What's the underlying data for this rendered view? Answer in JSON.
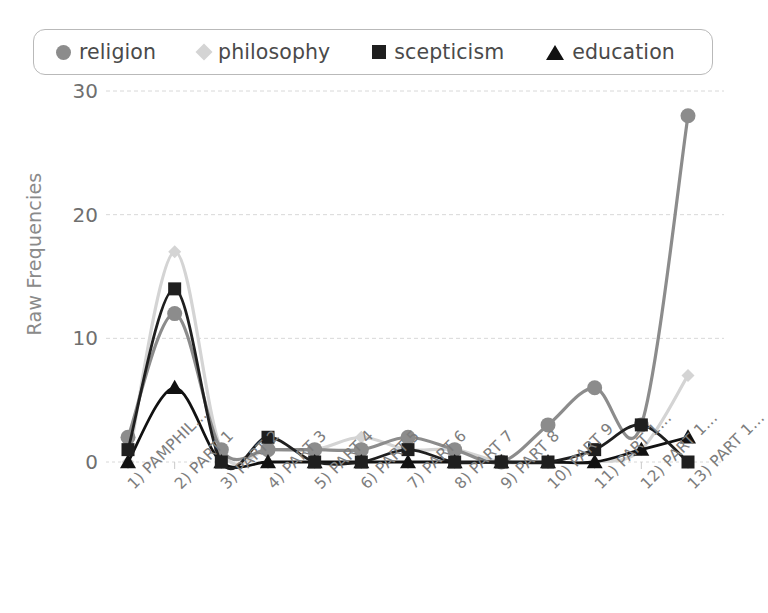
{
  "legend": {
    "position": "top",
    "items": [
      {
        "label": "religion",
        "marker": "circle",
        "color": "#8c8c8c",
        "name": "legend-marker-religion"
      },
      {
        "label": "philosophy",
        "marker": "diamond",
        "color": "#d4d4d4",
        "name": "legend-marker-philosophy"
      },
      {
        "label": "scepticism",
        "marker": "square",
        "color": "#1f1f1f",
        "name": "legend-marker-scepticism"
      },
      {
        "label": "education",
        "marker": "triangle",
        "color": "#111111",
        "name": "legend-marker-education"
      }
    ]
  },
  "chart_data": {
    "type": "line",
    "title": "",
    "xlabel": "",
    "ylabel": "Raw Frequencies",
    "ylim": [
      0,
      30
    ],
    "yticks": [
      0,
      10,
      20,
      30
    ],
    "grid": true,
    "legend_position": "top",
    "categories": [
      "1) PAMPHIL...",
      "2) PART 1",
      "3) PART 2",
      "4) PART 3",
      "5) PART 4",
      "6) PART 5",
      "7) PART 6",
      "8) PART 7",
      "9) PART 8",
      "10) PART 9",
      "11) PART 1...",
      "12) PART 1...",
      "13) PART 1..."
    ],
    "series": [
      {
        "name": "religion",
        "color": "#8c8c8c",
        "marker": "circle",
        "values": [
          2,
          12,
          1,
          1,
          1,
          1,
          2,
          1,
          0,
          3,
          6,
          3,
          28
        ]
      },
      {
        "name": "philosophy",
        "color": "#d4d4d4",
        "marker": "diamond",
        "values": [
          0,
          17,
          1,
          1,
          1,
          2,
          1,
          1,
          0,
          0,
          0,
          1,
          7
        ]
      },
      {
        "name": "scepticism",
        "color": "#1f1f1f",
        "marker": "square",
        "values": [
          1,
          14,
          0,
          2,
          0,
          0,
          1,
          0,
          0,
          0,
          1,
          3,
          0
        ]
      },
      {
        "name": "education",
        "color": "#111111",
        "marker": "triangle",
        "values": [
          0,
          6,
          0,
          0,
          0,
          0,
          0,
          0,
          0,
          0,
          0,
          1,
          2
        ]
      }
    ]
  },
  "axis": {
    "y_tick_labels": [
      "30",
      "20",
      "10",
      "0"
    ]
  }
}
